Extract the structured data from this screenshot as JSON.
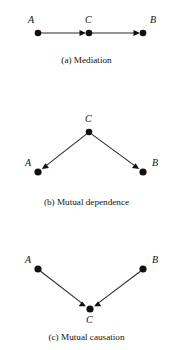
{
  "figure": {
    "background_color": "#ffffff",
    "ink_color": "#111111",
    "panels": [
      {
        "id": "a",
        "caption": "(a) Mediation",
        "pattern": "chain",
        "nodes": [
          {
            "id": "A",
            "label": "A",
            "x": 38,
            "y": 33,
            "label_x": 28,
            "label_y": 15
          },
          {
            "id": "C",
            "label": "C",
            "x": 89,
            "y": 33,
            "label_x": 85,
            "label_y": 15
          },
          {
            "id": "B",
            "label": "B",
            "x": 143,
            "y": 33,
            "label_x": 150,
            "label_y": 15
          }
        ],
        "edges": [
          {
            "from": "A",
            "to": "C",
            "arrow": "to"
          },
          {
            "from": "C",
            "to": "B",
            "arrow": "to"
          }
        ]
      },
      {
        "id": "b",
        "caption": "(b) Mutual dependence",
        "pattern": "fork",
        "nodes": [
          {
            "id": "C",
            "label": "C",
            "x": 89,
            "y": 132,
            "label_x": 85,
            "label_y": 114
          },
          {
            "id": "A",
            "label": "A",
            "x": 38,
            "y": 172,
            "label_x": 25,
            "label_y": 158
          },
          {
            "id": "B",
            "label": "B",
            "x": 143,
            "y": 172,
            "label_x": 152,
            "label_y": 158
          }
        ],
        "edges": [
          {
            "from": "C",
            "to": "A",
            "arrow": "to"
          },
          {
            "from": "C",
            "to": "B",
            "arrow": "to"
          }
        ]
      },
      {
        "id": "c",
        "caption": "(c) Mutual causation",
        "pattern": "collider",
        "nodes": [
          {
            "id": "A",
            "label": "A",
            "x": 38,
            "y": 269,
            "label_x": 25,
            "label_y": 255
          },
          {
            "id": "B",
            "label": "B",
            "x": 143,
            "y": 269,
            "label_x": 152,
            "label_y": 255
          },
          {
            "id": "C",
            "label": "C",
            "x": 90,
            "y": 309,
            "label_x": 86,
            "label_y": 315
          }
        ],
        "edges": [
          {
            "from": "A",
            "to": "C",
            "arrow": "to"
          },
          {
            "from": "B",
            "to": "C",
            "arrow": "to"
          }
        ]
      }
    ]
  }
}
